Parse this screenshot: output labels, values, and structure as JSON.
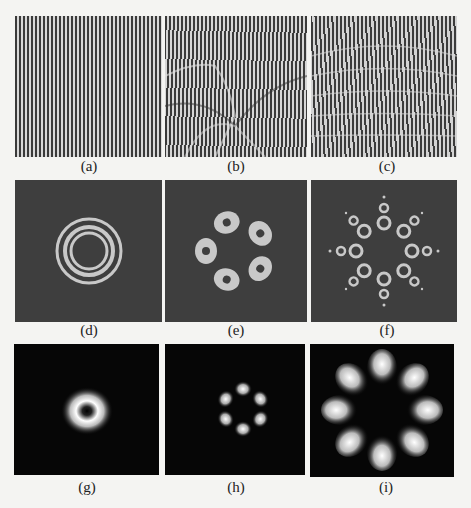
{
  "figure": {
    "panels": [
      {
        "id": "a",
        "label": "(a)",
        "type": "interference-fringes",
        "description": "vertical fringes with single fork dislocation near center-bottom"
      },
      {
        "id": "b",
        "label": "(b)",
        "type": "interference-fringes",
        "description": "vertical fringes with multiple distorted dislocations"
      },
      {
        "id": "c",
        "label": "(c)",
        "type": "interference-fringes",
        "description": "curved radial fringes with dislocation"
      },
      {
        "id": "d",
        "label": "(d)",
        "type": "intensity-contour",
        "description": "concentric rings"
      },
      {
        "id": "e",
        "label": "(e)",
        "type": "intensity-contour",
        "description": "five lobes arranged in ring"
      },
      {
        "id": "f",
        "label": "(f)",
        "type": "intensity-contour",
        "description": "eight inner lobes with eight outer small rings"
      },
      {
        "id": "g",
        "label": "(g)",
        "type": "intensity-profile",
        "description": "single donut beam"
      },
      {
        "id": "h",
        "label": "(h)",
        "type": "intensity-profile",
        "description": "six-petal pattern"
      },
      {
        "id": "i",
        "label": "(i)",
        "type": "intensity-profile",
        "description": "eight-petal pattern"
      }
    ]
  },
  "colors": {
    "background": "#f4f4f2",
    "contour_bg": "#3e3e3e",
    "contour_fg": "#c8c8c8",
    "profile_bg": "#060606",
    "profile_fg": "#ffffff"
  }
}
